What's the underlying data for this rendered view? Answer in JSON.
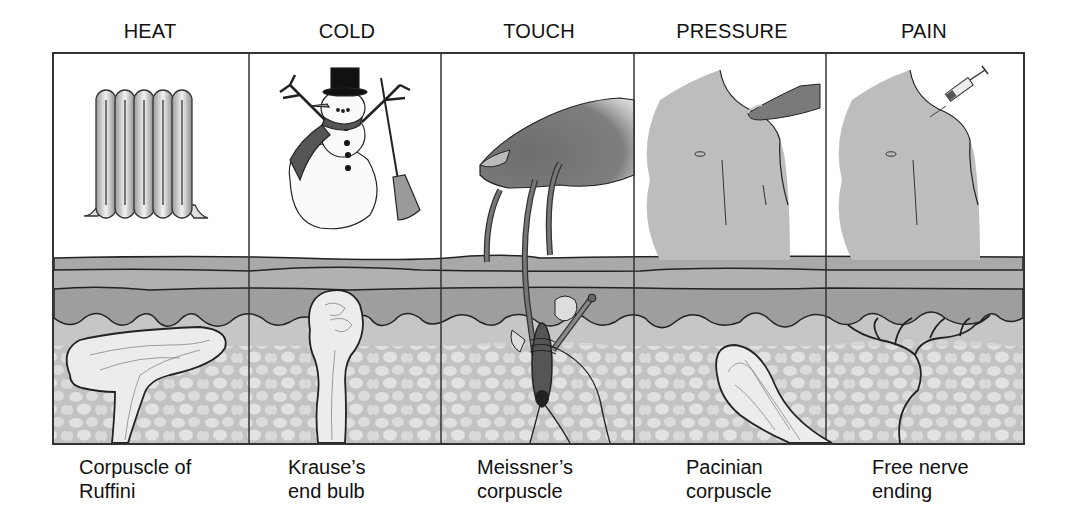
{
  "figure": {
    "columns": [
      {
        "stimulus": "HEAT",
        "receptor_line1": "Corpuscle of",
        "receptor_line2": "Ruffini",
        "illustration": "radiator-icon"
      },
      {
        "stimulus": "COLD",
        "receptor_line1": "Krause’s",
        "receptor_line2": "end bulb",
        "illustration": "snowman-icon"
      },
      {
        "stimulus": "TOUCH",
        "receptor_line1": "Meissner’s",
        "receptor_line2": "corpuscle",
        "illustration": "finger-touching-hair-icon"
      },
      {
        "stimulus": "PRESSURE",
        "receptor_line1": "Pacinian",
        "receptor_line2": "corpuscle",
        "illustration": "finger-pressing-shoulder-icon"
      },
      {
        "stimulus": "PAIN",
        "receptor_line1": "Free nerve",
        "receptor_line2": "ending",
        "illustration": "syringe-shoulder-icon"
      }
    ],
    "colors": {
      "outline": "#222222",
      "stratum": "#a9a9a9",
      "epidermis": "#9c9c9c",
      "dermis": "#c4c4c4",
      "fat_cells": "#dedede",
      "skin_tone": "#bdbdbd",
      "finger": "#7a7a7a"
    }
  }
}
